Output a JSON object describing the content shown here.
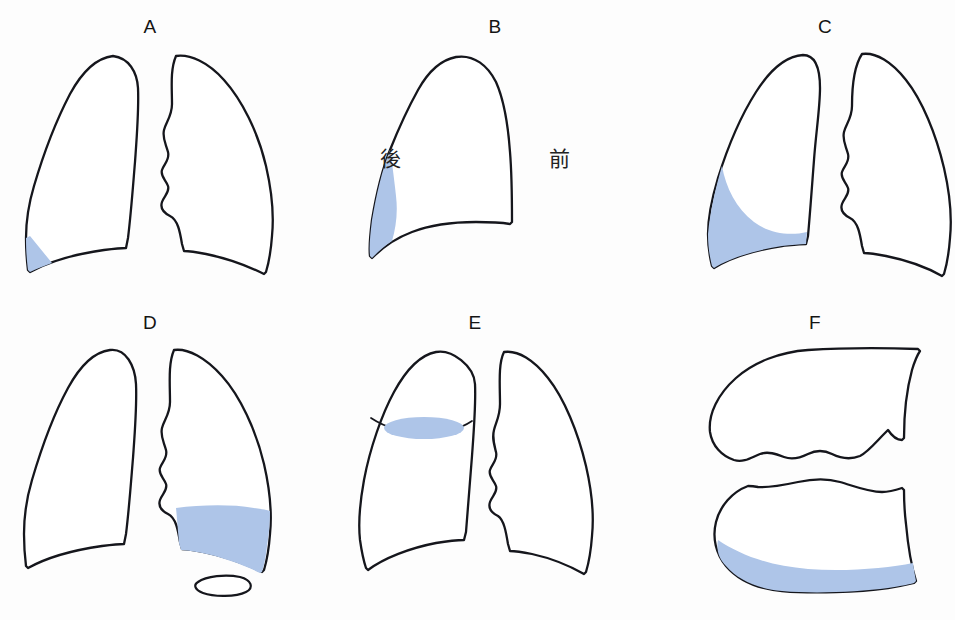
{
  "figure": {
    "background_color": "#fdfdfd",
    "outline_color": "#15161c",
    "effusion_color": "#aec5e8",
    "panel_count": 6
  },
  "panels": [
    {
      "letter": "A",
      "view": "frontal",
      "description": "Small effusion blunting the left costophrenic angle",
      "effusion_shape": "small-triangular-wedge",
      "effusion_side": "left"
    },
    {
      "letter": "B",
      "view": "lateral",
      "description": "Lateral view showing posterior costophrenic recess fluid",
      "effusion_shape": "posterior-crescent",
      "effusion_side": "posterior",
      "labels": {
        "posterior": "後",
        "anterior": "前"
      }
    },
    {
      "letter": "C",
      "view": "frontal",
      "description": "Moderate effusion with concave meniscus sign",
      "effusion_shape": "meniscus",
      "effusion_side": "left"
    },
    {
      "letter": "D",
      "view": "frontal",
      "description": "Effusion with flat air-fluid level and gastric bubble below",
      "effusion_shape": "air-fluid-level",
      "effusion_side": "right",
      "extra_feature": "gastric-bubble"
    },
    {
      "letter": "E",
      "view": "frontal",
      "description": "Loculated interlobar fluid in the fissure, lens shaped",
      "effusion_shape": "lens-in-fissure",
      "effusion_side": "left"
    },
    {
      "letter": "F",
      "view": "lateral-decubitus",
      "description": "Decubitus view with fluid layering along the dependent margin",
      "effusion_shape": "dependent-layering",
      "effusion_side": "dependent"
    }
  ]
}
